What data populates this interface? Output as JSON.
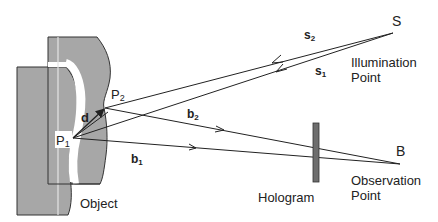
{
  "diagram": {
    "type": "holographic interferometry geometry",
    "colors": {
      "object_fill": "#a7a7a7",
      "hologram_fill": "#6e6e6e",
      "line": "#222222",
      "band": "#ffffff"
    },
    "points": {
      "P1": {
        "label": "P",
        "sub": "1"
      },
      "P2": {
        "label": "P",
        "sub": "2"
      },
      "S": {
        "label": "S",
        "caption_line1": "Illumination",
        "caption_line2": "Point"
      },
      "B": {
        "label": "B",
        "caption_line1": "Observation",
        "caption_line2": "Point"
      }
    },
    "vectors": {
      "d": "d",
      "s1": {
        "label": "s",
        "sub": "1"
      },
      "s2": {
        "label": "s",
        "sub": "2"
      },
      "b1": {
        "label": "b",
        "sub": "1"
      },
      "b2": {
        "label": "b",
        "sub": "2"
      }
    },
    "labels": {
      "object": "Object",
      "hologram": "Hologram"
    }
  }
}
